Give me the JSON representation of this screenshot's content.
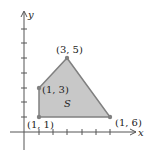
{
  "diagram": {
    "type": "region-plot",
    "region_label": "S",
    "axes": {
      "x_label": "x",
      "y_label": "y"
    },
    "vertices": [
      {
        "label": "(1, 1)"
      },
      {
        "label": "(1, 3)"
      },
      {
        "label": "(3, 5)"
      },
      {
        "label": "(1, 6)"
      }
    ],
    "colors": {
      "fill": "#c8c8c8",
      "edge": "#808080",
      "axis": "#555555"
    }
  }
}
